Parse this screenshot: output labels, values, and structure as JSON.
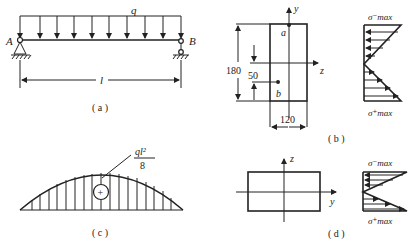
{
  "figure_a": {
    "caption": "( a )",
    "load_label": "q",
    "support_left": "A",
    "support_right": "B",
    "span_label": "l",
    "load_arrow_count": 10
  },
  "figure_b": {
    "caption": "( b )",
    "axis_vertical": "y",
    "axis_horizontal": "z",
    "height_dim": "180",
    "width_dim": "120",
    "offset_dim": "50",
    "point_top": "a",
    "point_bottom": "b",
    "stress_top": "σ⁻max",
    "stress_bottom": "σ⁺max"
  },
  "figure_c": {
    "caption": "( c )",
    "max_moment_num": "ql²",
    "max_moment_den": "8",
    "sign": "+"
  },
  "figure_d": {
    "caption": "( d )",
    "axis_vertical": "z",
    "axis_horizontal": "y",
    "stress_top": "σ⁻max",
    "stress_bottom": "σ⁺max"
  }
}
